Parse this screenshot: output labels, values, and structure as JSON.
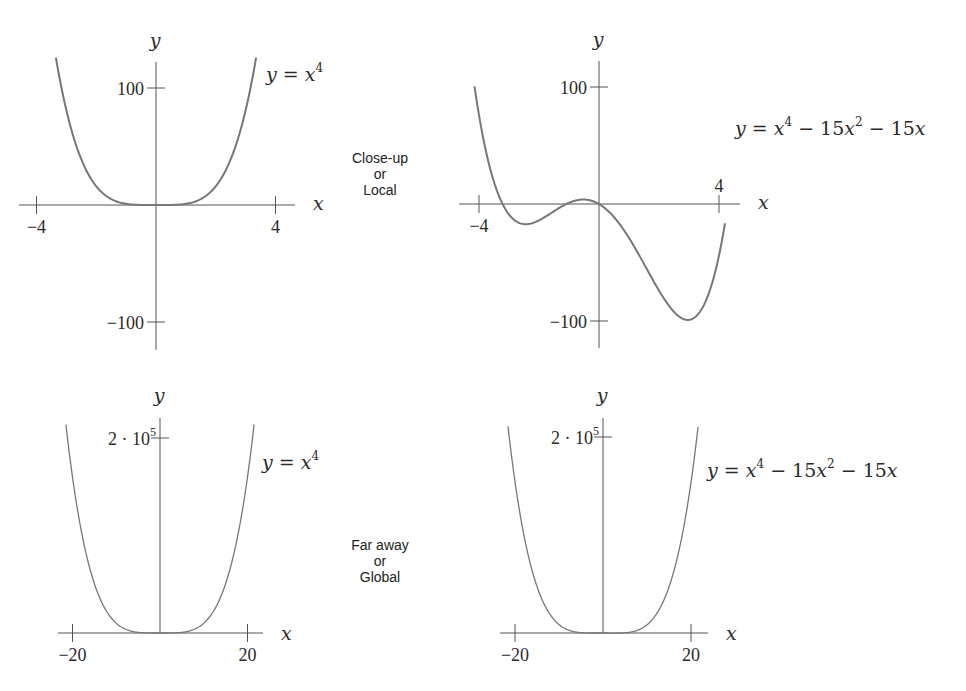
{
  "row_labels": {
    "local": [
      "Close-up",
      "or",
      "Local"
    ],
    "global": [
      "Far away",
      "or",
      "Global"
    ]
  },
  "colors": {
    "axis": "#555555",
    "curve": "#777777",
    "text": "#2a2a2a"
  },
  "chart_data": [
    {
      "type": "line",
      "id": "local-x4",
      "equation": "y = x^4",
      "label_parts": [
        "y",
        "=",
        "x",
        "4"
      ],
      "xlabel": "x",
      "ylabel": "y",
      "xlim": [
        -4.6,
        5.2
      ],
      "ylim": [
        -122,
        122
      ],
      "x_ticks": [
        {
          "v": -4,
          "label": "−4"
        },
        {
          "v": 4,
          "label": "4"
        }
      ],
      "y_ticks": [
        {
          "v": 100,
          "label": "100"
        },
        {
          "v": -100,
          "label": "−100"
        }
      ],
      "curve_domain": [
        -3.35,
        3.35
      ],
      "coeffs": [
        0,
        0,
        0,
        0,
        1
      ]
    },
    {
      "type": "line",
      "id": "local-quartic",
      "equation": "y = x^4 − 15x^2 − 15x",
      "label_parts": [
        "y",
        "=",
        "x",
        "4",
        "−",
        "15x",
        "2",
        "−",
        "15x"
      ],
      "xlabel": "x",
      "ylabel": "y",
      "xlim": [
        -4.6,
        5.2
      ],
      "ylim": [
        -122,
        122
      ],
      "x_ticks": [
        {
          "v": -4,
          "label": "−4"
        },
        {
          "v": 4,
          "label": "4"
        }
      ],
      "y_ticks": [
        {
          "v": 100,
          "label": "100"
        },
        {
          "v": -100,
          "label": "−100"
        }
      ],
      "curve_domain": [
        -4.15,
        4.2
      ],
      "coeffs": [
        0,
        -15,
        -15,
        0,
        1
      ]
    },
    {
      "type": "line",
      "id": "global-x4",
      "equation": "y = x^4",
      "label_parts": [
        "y",
        "=",
        "x",
        "4"
      ],
      "xlabel": "x",
      "ylabel": "y",
      "xlim": [
        -24,
        26
      ],
      "ylim": [
        0,
        220000
      ],
      "x_ticks": [
        {
          "v": -20,
          "label": "−20"
        },
        {
          "v": 20,
          "label": "20"
        }
      ],
      "y_ticks": [
        {
          "v": 200000,
          "label": "2 · 10",
          "sup": "5"
        }
      ],
      "curve_domain": [
        -21.5,
        21.5
      ],
      "coeffs": [
        0,
        0,
        0,
        0,
        1
      ]
    },
    {
      "type": "line",
      "id": "global-quartic",
      "equation": "y = x^4 − 15x^2 − 15x",
      "label_parts": [
        "y",
        "=",
        "x",
        "4",
        "−",
        "15x",
        "2",
        "−",
        "15x"
      ],
      "xlabel": "x",
      "ylabel": "y",
      "xlim": [
        -24,
        26
      ],
      "ylim": [
        0,
        220000
      ],
      "x_ticks": [
        {
          "v": -20,
          "label": "−20"
        },
        {
          "v": 20,
          "label": "20"
        }
      ],
      "y_ticks": [
        {
          "v": 200000,
          "label": "2 · 10",
          "sup": "5"
        }
      ],
      "curve_domain": [
        -21.6,
        21.6
      ],
      "coeffs": [
        0,
        -15,
        -15,
        0,
        1
      ]
    }
  ]
}
